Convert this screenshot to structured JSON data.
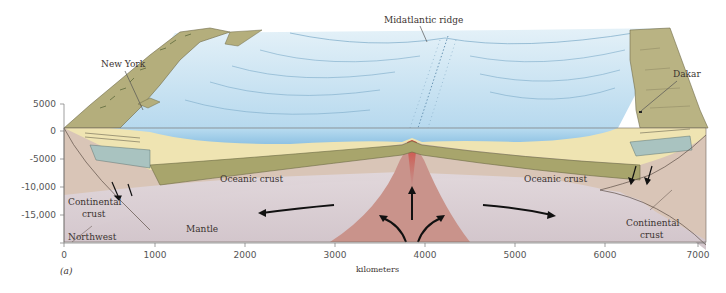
{
  "diagram": {
    "panel_label": "(a)",
    "y_axis": {
      "ticks": [
        "5000",
        "0",
        "-5000",
        "-10,000",
        "-15,000"
      ]
    },
    "x_axis": {
      "title": "kilometers",
      "ticks": [
        "0",
        "1000",
        "2000",
        "3000",
        "4000",
        "5000",
        "6000",
        "7000"
      ]
    },
    "labels": {
      "midatlantic_ridge": "Midatlantic ridge",
      "new_york": "New York",
      "dakar": "Dakar",
      "oceanic_crust_left": "Oceanic crust",
      "oceanic_crust_right": "Oceanic crust",
      "continental_crust_left_1": "Continental",
      "continental_crust_left_2": "crust",
      "continental_crust_right_1": "Continental",
      "continental_crust_right_2": "crust",
      "mantle": "Mantle",
      "northwest": "Northwest"
    },
    "colors": {
      "ocean_surface": "#cfe6f3",
      "ocean_deep": "#9fcbe6",
      "land": "#b9b383",
      "sediment": "#efe4b0",
      "limestone": "#a9c3c0",
      "oceanic_crust": "#a6a66b",
      "mantle": "#d8ccd0",
      "continental_crust": "#d7c4b6",
      "upwelling": "#c98a84",
      "magma": "#d44f48"
    }
  }
}
